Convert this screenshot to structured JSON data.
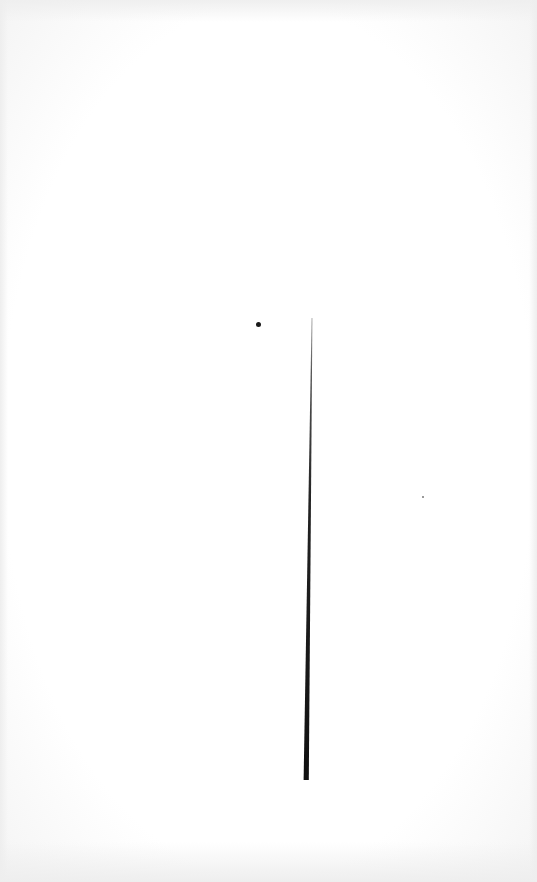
{
  "scene": {
    "description": "White surface with a thin dark tapering line and a small dot",
    "background_color": "#ffffff",
    "vignette_color": "#eeeeee"
  },
  "objects": {
    "line": {
      "color": "#1a1a1a",
      "top": {
        "x": 312,
        "y": 318
      },
      "bottom": {
        "x": 306,
        "y": 780
      },
      "top_width": 1,
      "bottom_width": 5
    },
    "dot": {
      "color": "#1a1a1a",
      "x": 258,
      "y": 324,
      "diameter": 5
    },
    "speck": {
      "color": "#9a9a9a",
      "x": 423,
      "y": 497
    }
  }
}
